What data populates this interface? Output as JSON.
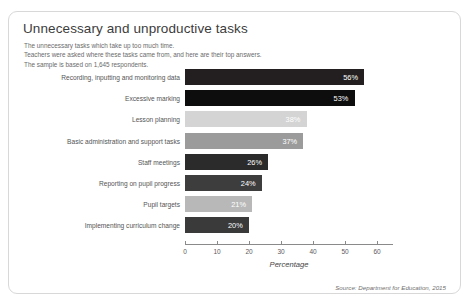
{
  "card": {
    "title": "Unnecessary and unproductive tasks",
    "subtitle": [
      "The unnecessary tasks which take up too much time.",
      "Teachers were asked where these tasks came from, and here are their top answers.",
      "The sample is based on 1,645 respondents."
    ],
    "source": "Source: Department for Education, 2015"
  },
  "chart_data": {
    "type": "bar",
    "orientation": "horizontal",
    "title": "Unnecessary and unproductive tasks",
    "xlabel": "Percentage",
    "ylabel": "",
    "xlim": [
      0,
      65
    ],
    "xticks": [
      0,
      10,
      20,
      30,
      40,
      50,
      60
    ],
    "grid": false,
    "legend": false,
    "categories": [
      "Recording, inputting and monitoring data",
      "Excessive marking",
      "Lesson planning",
      "Basic administration and support tasks",
      "Staff meetings",
      "Reporting on pupil progress",
      "Pupil targets",
      "Implementing curriculum change"
    ],
    "values": [
      56,
      53,
      38,
      37,
      26,
      24,
      21,
      20
    ],
    "value_labels": [
      "56%",
      "53%",
      "38%",
      "37%",
      "26%",
      "24%",
      "21%",
      "20%"
    ],
    "bar_colors": [
      "#231f20",
      "#0d0d0d",
      "#d4d4d4",
      "#9b9b9b",
      "#2b2b2b",
      "#3d3d3d",
      "#b8b8b8",
      "#3a3a3a"
    ]
  }
}
